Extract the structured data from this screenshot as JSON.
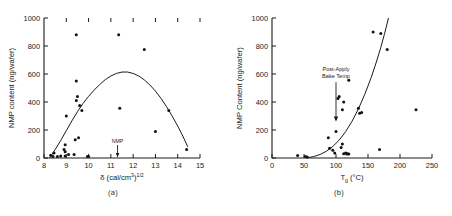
{
  "figure": {
    "panels": [
      {
        "id": "a",
        "subcaption": "(a)",
        "annotation": {
          "text": "NMP",
          "x_value": 11.3
        }
      },
      {
        "id": "b",
        "subcaption": "(b)",
        "annotation": {
          "line1": "Post-Apply",
          "line2": "Bake Temp",
          "x_value": 100
        }
      }
    ]
  },
  "chart_data": [
    {
      "type": "scatter",
      "title": "",
      "panel": "(a)",
      "xlabel": "δ (cal/cm3)1/2",
      "xlabel_parts": {
        "symbol": "δ",
        "open": " (cal/cm",
        "sup1": "3",
        "close": ")",
        "sup2": "1/2"
      },
      "ylabel": "NMP content (ng/wafer)",
      "xlim": [
        8,
        15
      ],
      "ylim": [
        0,
        1000
      ],
      "xticks": [
        8,
        9,
        10,
        11,
        12,
        13,
        14,
        15
      ],
      "yticks": [
        0,
        200,
        400,
        600,
        800,
        1000
      ],
      "grid": false,
      "legend": "none",
      "annotations": [
        {
          "label": "NMP",
          "x": 11.3,
          "y": 0,
          "arrow": "down"
        }
      ],
      "points": [
        [
          8.3,
          20
        ],
        [
          8.4,
          10
        ],
        [
          8.45,
          35
        ],
        [
          8.6,
          10
        ],
        [
          8.75,
          15
        ],
        [
          8.9,
          60
        ],
        [
          8.95,
          95
        ],
        [
          8.95,
          45
        ],
        [
          8.95,
          15
        ],
        [
          9.0,
          300
        ],
        [
          9.1,
          25
        ],
        [
          9.35,
          25
        ],
        [
          9.4,
          130
        ],
        [
          9.45,
          880
        ],
        [
          9.45,
          550
        ],
        [
          9.45,
          410
        ],
        [
          9.5,
          440
        ],
        [
          9.55,
          145
        ],
        [
          9.6,
          375
        ],
        [
          9.7,
          340
        ],
        [
          9.95,
          10
        ],
        [
          10.0,
          10
        ],
        [
          11.35,
          880
        ],
        [
          11.4,
          355
        ],
        [
          12.5,
          775
        ],
        [
          13.0,
          190
        ],
        [
          13.6,
          340
        ],
        [
          14.4,
          60
        ]
      ],
      "curve": {
        "description": "inverted parabola peaking near delta=11.6",
        "peak_x": 11.6,
        "peak_y": 615,
        "points": [
          [
            8.25,
            0
          ],
          [
            8.5,
            60
          ],
          [
            8.75,
            125
          ],
          [
            9.0,
            195
          ],
          [
            9.25,
            265
          ],
          [
            9.5,
            330
          ],
          [
            9.75,
            390
          ],
          [
            10.0,
            440
          ],
          [
            10.25,
            485
          ],
          [
            10.5,
            525
          ],
          [
            10.75,
            560
          ],
          [
            11.0,
            586
          ],
          [
            11.25,
            604
          ],
          [
            11.5,
            614
          ],
          [
            11.75,
            614
          ],
          [
            12.0,
            604
          ],
          [
            12.25,
            586
          ],
          [
            12.5,
            558
          ],
          [
            12.75,
            522
          ],
          [
            13.0,
            478
          ],
          [
            13.25,
            426
          ],
          [
            13.5,
            366
          ],
          [
            13.75,
            300
          ],
          [
            14.0,
            228
          ],
          [
            14.25,
            150
          ],
          [
            14.45,
            80
          ]
        ]
      }
    },
    {
      "type": "scatter",
      "title": "",
      "panel": "(b)",
      "xlabel": "Tg (°C)",
      "xlabel_parts": {
        "symbol": "T",
        "sub": "g",
        "unit": " (°C)"
      },
      "ylabel": "NMP Content (ng/wafer)",
      "xlim": [
        0,
        250
      ],
      "ylim": [
        0,
        1000
      ],
      "xticks": [
        0,
        50,
        100,
        150,
        200,
        250
      ],
      "yticks": [
        0,
        200,
        400,
        600,
        800,
        1000
      ],
      "grid": false,
      "legend": "none",
      "annotations": [
        {
          "label": "Post-Apply Bake Temp",
          "x": 100,
          "y_text": 620,
          "y_arrow_end": 260,
          "arrow": "down"
        }
      ],
      "points": [
        [
          40,
          18
        ],
        [
          52,
          10
        ],
        [
          55,
          8
        ],
        [
          88,
          145
        ],
        [
          90,
          70
        ],
        [
          95,
          55
        ],
        [
          98,
          35
        ],
        [
          100,
          190
        ],
        [
          103,
          425
        ],
        [
          105,
          440
        ],
        [
          108,
          75
        ],
        [
          110,
          100
        ],
        [
          110,
          345
        ],
        [
          112,
          400
        ],
        [
          112,
          30
        ],
        [
          115,
          35
        ],
        [
          117,
          28
        ],
        [
          118,
          30
        ],
        [
          120,
          28
        ],
        [
          120,
          555
        ],
        [
          135,
          355
        ],
        [
          137,
          320
        ],
        [
          140,
          325
        ],
        [
          158,
          900
        ],
        [
          168,
          60
        ],
        [
          170,
          890
        ],
        [
          180,
          775
        ],
        [
          225,
          345
        ]
      ],
      "curve": {
        "description": "exponential rise from near zero at Tg=55 to 1000 at Tg=182",
        "points": [
          [
            55,
            2
          ],
          [
            65,
            10
          ],
          [
            75,
            25
          ],
          [
            85,
            48
          ],
          [
            95,
            82
          ],
          [
            105,
            128
          ],
          [
            115,
            188
          ],
          [
            125,
            262
          ],
          [
            135,
            350
          ],
          [
            145,
            455
          ],
          [
            155,
            575
          ],
          [
            163,
            685
          ],
          [
            170,
            790
          ],
          [
            176,
            890
          ],
          [
            182,
            1000
          ]
        ]
      }
    }
  ]
}
